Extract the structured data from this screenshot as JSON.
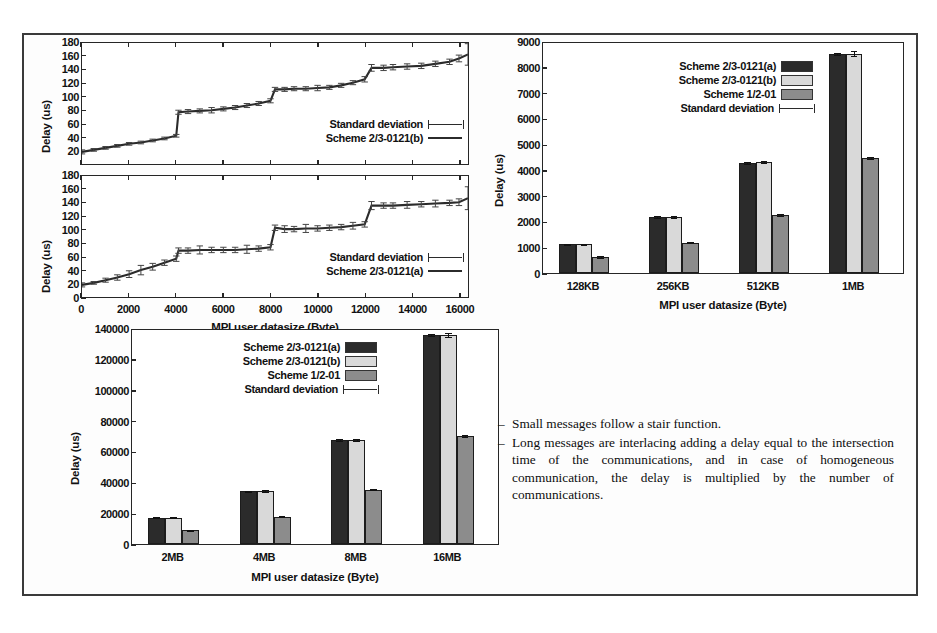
{
  "figure": {
    "border_color": "#3a3a3a",
    "background": "#ffffff"
  },
  "colors": {
    "series_a": "#2b2b2b",
    "series_b": "#d9d9d9",
    "series_c": "#8c8c8c",
    "axis": "#262626"
  },
  "notes": {
    "dash": "–",
    "items": [
      "Small messages follow a stair function.",
      "Long messages are interlacing adding a delay equal to the intersection time of the communications, and in case of homogeneous communication, the delay is multiplied by the number of communications."
    ]
  },
  "chart_data": [
    {
      "id": "line-chart-b",
      "type": "line",
      "title": "",
      "xlabel": "",
      "ylabel": "Delay (us)",
      "xlim": [
        0,
        16384
      ],
      "ylim": [
        0,
        180
      ],
      "yticks": [
        180,
        160,
        140,
        120,
        100,
        80,
        60,
        40,
        20
      ],
      "xticks": [
        0,
        2000,
        4000,
        6000,
        8000,
        10000,
        12000,
        14000,
        16000
      ],
      "xticklabels": [
        "",
        "",
        "",
        "",
        "",
        "",
        "",
        "",
        ""
      ],
      "grid": false,
      "legend_position": "bottom-right",
      "legend": [
        "Standard deviation",
        "Scheme 2/3-0121(b)"
      ],
      "series": [
        {
          "name": "Scheme 2/3-0121(b)",
          "x": [
            0,
            500,
            1000,
            1500,
            2000,
            2500,
            3000,
            3500,
            4000,
            4096,
            4500,
            5000,
            5500,
            6000,
            6500,
            7000,
            7500,
            8000,
            8192,
            8600,
            9000,
            9500,
            10000,
            10500,
            11000,
            11500,
            12000,
            12288,
            12800,
            13200,
            13800,
            14400,
            15000,
            15600,
            16000,
            16384
          ],
          "values": [
            18,
            21,
            24,
            27,
            30,
            32,
            35,
            38,
            42,
            77,
            78,
            79,
            80,
            82,
            84,
            87,
            90,
            94,
            111,
            111,
            112,
            112,
            113,
            114,
            117,
            121,
            126,
            143,
            143,
            144,
            145,
            146,
            149,
            152,
            157,
            163
          ],
          "errors": [
            3,
            2,
            2,
            2,
            2,
            2,
            2,
            2,
            2,
            3,
            3,
            3,
            4,
            3,
            3,
            3,
            3,
            3,
            3,
            3,
            3,
            3,
            4,
            3,
            3,
            3,
            4,
            5,
            4,
            4,
            4,
            4,
            4,
            4,
            5,
            16
          ]
        }
      ]
    },
    {
      "id": "line-chart-a",
      "type": "line",
      "title": "",
      "xlabel": "MPI user datasize (Byte)",
      "ylabel": "Delay (us)",
      "xlim": [
        0,
        16384
      ],
      "ylim": [
        0,
        180
      ],
      "yticks": [
        180,
        160,
        140,
        120,
        100,
        80,
        60,
        40,
        20,
        0
      ],
      "xticks": [
        0,
        2000,
        4000,
        6000,
        8000,
        10000,
        12000,
        14000,
        16000
      ],
      "xticklabels": [
        "0",
        "2000",
        "4000",
        "6000",
        "8000",
        "10000",
        "12000",
        "14000",
        "16000"
      ],
      "grid": false,
      "legend_position": "bottom-right",
      "legend": [
        "Standard deviation",
        "Scheme 2/3-0121(a)"
      ],
      "series": [
        {
          "name": "Scheme 2/3-0121(a)",
          "x": [
            0,
            500,
            1000,
            1500,
            2000,
            2500,
            3000,
            3500,
            4000,
            4096,
            4500,
            5000,
            5500,
            6000,
            6500,
            7000,
            7500,
            8000,
            8192,
            8600,
            9000,
            9500,
            10000,
            10500,
            11000,
            11500,
            12000,
            12288,
            12800,
            13200,
            13800,
            14400,
            15000,
            15600,
            16000,
            16384
          ],
          "values": [
            18,
            21,
            25,
            29,
            34,
            40,
            45,
            51,
            57,
            69,
            69,
            70,
            70,
            70,
            70,
            71,
            72,
            74,
            103,
            101,
            101,
            102,
            102,
            103,
            104,
            106,
            108,
            136,
            136,
            136,
            137,
            138,
            139,
            140,
            141,
            147
          ],
          "errors": [
            3,
            2,
            3,
            4,
            5,
            7,
            5,
            4,
            4,
            4,
            4,
            6,
            4,
            4,
            4,
            6,
            4,
            4,
            4,
            5,
            4,
            6,
            4,
            4,
            4,
            5,
            4,
            6,
            4,
            4,
            5,
            4,
            5,
            4,
            5,
            17
          ]
        }
      ]
    },
    {
      "id": "bar-chart-small",
      "type": "bar",
      "title": "",
      "xlabel": "MPI user datasize (Byte)",
      "ylabel": "Delay (us)",
      "categories": [
        "128KB",
        "256KB",
        "512KB",
        "1MB"
      ],
      "ylim": [
        0,
        9000
      ],
      "yticks": [
        9000,
        8000,
        7000,
        6000,
        5000,
        4000,
        3000,
        2000,
        1000,
        0
      ],
      "grid": false,
      "legend_position": "top-center",
      "legend": [
        "Scheme 2/3-0121(a)",
        "Scheme 2/3-0121(b)",
        "Scheme 1/2-01",
        "Standard deviation"
      ],
      "series": [
        {
          "name": "Scheme 2/3-0121(a)",
          "values": [
            1130,
            2200,
            4320,
            8580
          ],
          "errors": [
            20,
            30,
            40,
            45
          ]
        },
        {
          "name": "Scheme 2/3-0121(b)",
          "values": [
            1120,
            2200,
            4330,
            8580
          ],
          "errors": [
            30,
            40,
            45,
            90
          ]
        },
        {
          "name": "Scheme 1/2-01",
          "values": [
            640,
            1190,
            2280,
            4500
          ],
          "errors": [
            35,
            25,
            40,
            45
          ]
        }
      ]
    },
    {
      "id": "bar-chart-large",
      "type": "bar",
      "title": "",
      "xlabel": "MPI user datasize (Byte)",
      "ylabel": "Delay (us)",
      "categories": [
        "2MB",
        "4MB",
        "8MB",
        "16MB"
      ],
      "ylim": [
        0,
        140000
      ],
      "yticks": [
        140000,
        120000,
        100000,
        80000,
        60000,
        40000,
        20000,
        0
      ],
      "grid": false,
      "legend_position": "top-center",
      "legend": [
        "Scheme 2/3-0121(a)",
        "Scheme 2/3-0121(b)",
        "Scheme 1/2-01",
        "Standard deviation"
      ],
      "series": [
        {
          "name": "Scheme 2/3-0121(a)",
          "values": [
            17200,
            34500,
            68000,
            136500
          ],
          "errors": [
            400,
            500,
            500,
            700
          ]
        },
        {
          "name": "Scheme 2/3-0121(b)",
          "values": [
            17300,
            34600,
            68300,
            136800
          ],
          "errors": [
            600,
            600,
            700,
            1500
          ]
        },
        {
          "name": "Scheme 1/2-01",
          "values": [
            9000,
            18000,
            35500,
            70500
          ],
          "errors": [
            300,
            400,
            400,
            500
          ]
        }
      ]
    }
  ]
}
